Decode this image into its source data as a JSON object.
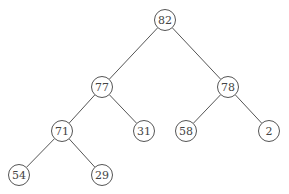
{
  "diagram": {
    "type": "binary-tree",
    "node_radius": 10.5,
    "nodes": [
      {
        "id": "n82",
        "label": "82",
        "x": 165,
        "y": 20
      },
      {
        "id": "n77",
        "label": "77",
        "x": 102,
        "y": 87
      },
      {
        "id": "n78",
        "label": "78",
        "x": 228,
        "y": 87
      },
      {
        "id": "n71",
        "label": "71",
        "x": 62,
        "y": 131
      },
      {
        "id": "n31",
        "label": "31",
        "x": 144,
        "y": 131
      },
      {
        "id": "n58",
        "label": "58",
        "x": 186,
        "y": 131
      },
      {
        "id": "n2",
        "label": "2",
        "x": 269,
        "y": 131
      },
      {
        "id": "n54",
        "label": "54",
        "x": 19,
        "y": 175
      },
      {
        "id": "n29",
        "label": "29",
        "x": 102,
        "y": 175
      }
    ],
    "edges": [
      {
        "from": "n82",
        "to": "n77"
      },
      {
        "from": "n82",
        "to": "n78"
      },
      {
        "from": "n77",
        "to": "n71"
      },
      {
        "from": "n77",
        "to": "n31"
      },
      {
        "from": "n78",
        "to": "n58"
      },
      {
        "from": "n78",
        "to": "n2"
      },
      {
        "from": "n71",
        "to": "n54"
      },
      {
        "from": "n71",
        "to": "n29"
      }
    ],
    "colors": {
      "stroke": "#555555",
      "text": "#444444",
      "background": "#ffffff"
    }
  }
}
